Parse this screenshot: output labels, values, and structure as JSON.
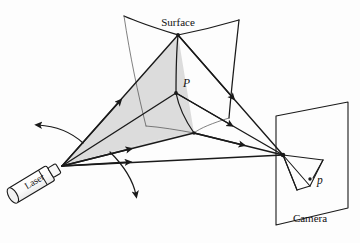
{
  "figure": {
    "type": "line-diagram",
    "background_color": "#fdfdfd",
    "line_color": "#1a1a1a",
    "shade_color": "#dcdcdc"
  },
  "labels": {
    "surface": "Surface",
    "point_world": "P",
    "point_image": "p",
    "camera": "Camera",
    "laser": "Laser"
  },
  "elements": {
    "surface_patch_name": "curved-surface-patch",
    "light_sheet_name": "laser-light-sheet",
    "camera_plane_name": "camera-image-plane",
    "camera_cone_name": "camera-view-cone",
    "laser_body_name": "laser-emitter",
    "rotation_arrow_left_name": "sweep-arrow-left",
    "rotation_arrow_down_name": "sweep-arrow-down"
  },
  "geometry": {
    "laser_apex": [
      62,
      166
    ],
    "surface_top_vertex": [
      178,
      35
    ],
    "point_P": [
      176,
      93
    ],
    "camera_center": [
      283,
      155
    ],
    "stripe_bottom": [
      194,
      133
    ]
  }
}
